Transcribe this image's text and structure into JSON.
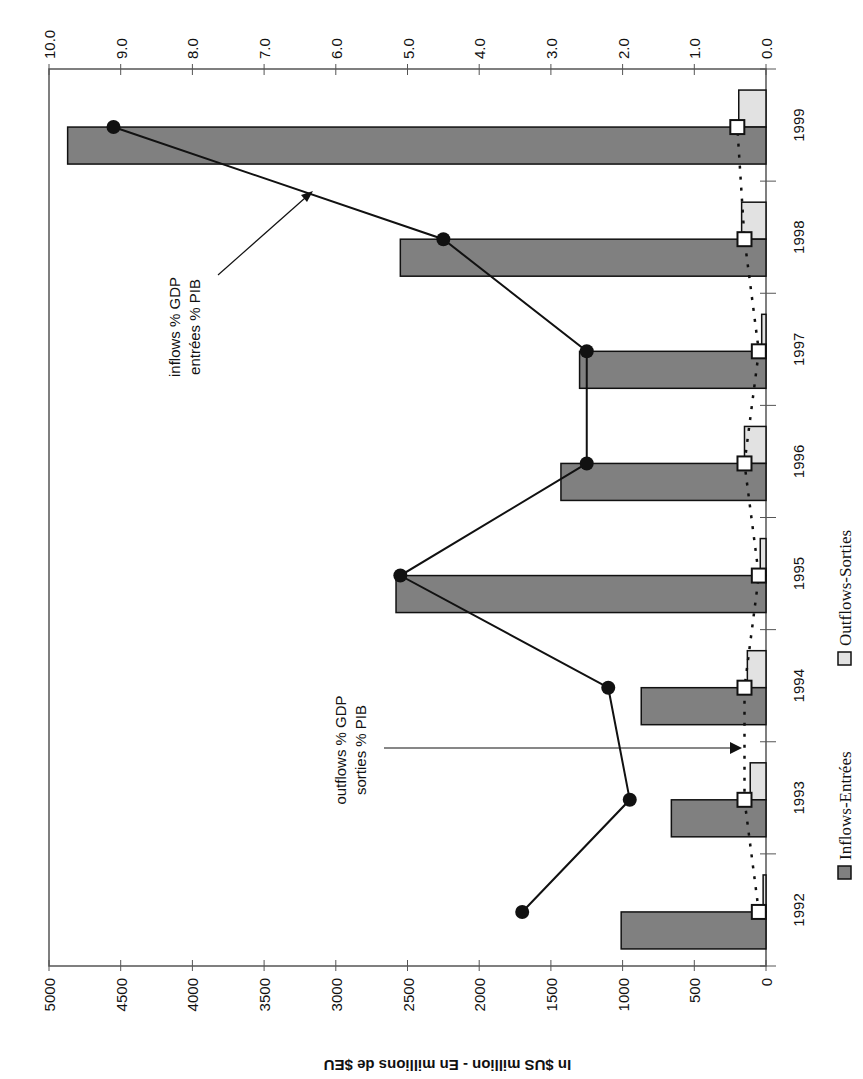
{
  "chart_data": {
    "type": "bar",
    "orientation": "rotated-90-clockwise",
    "title": "",
    "categories": [
      "1992",
      "1993",
      "1994",
      "1995",
      "1996",
      "1997",
      "1998",
      "1999"
    ],
    "series": [
      {
        "name": "Inflows-Entrées",
        "type": "bar",
        "axis": "left",
        "color": "#808080",
        "values": [
          1010,
          660,
          870,
          2580,
          1430,
          1300,
          2550,
          4870
        ]
      },
      {
        "name": "Outflows-Sorties",
        "type": "bar",
        "axis": "left",
        "color": "#e2e2e2",
        "values": [
          20,
          110,
          130,
          40,
          150,
          30,
          170,
          190
        ]
      },
      {
        "name": "inflows % GDP / entrées % PIB",
        "type": "line",
        "axis": "right",
        "marker": "filled-circle",
        "line_style": "solid",
        "values": [
          3.4,
          1.9,
          2.2,
          5.1,
          2.5,
          2.5,
          4.5,
          9.1
        ]
      },
      {
        "name": "outflows % GDP / sorties % PIB",
        "type": "line",
        "axis": "right",
        "marker": "open-square",
        "line_style": "dotted",
        "values": [
          0.1,
          0.3,
          0.3,
          0.1,
          0.3,
          0.1,
          0.3,
          0.4
        ]
      }
    ],
    "ylabel": "In $US million - En millions de $EU",
    "ylim": [
      0,
      5000
    ],
    "yticks": [
      "0",
      "500",
      "1000",
      "1500",
      "2000",
      "2500",
      "3000",
      "3500",
      "4000",
      "4500",
      "5000"
    ],
    "y2label": "",
    "y2lim": [
      0,
      10
    ],
    "y2ticks": [
      "0.0",
      "1.0",
      "2.0",
      "3.0",
      "4.0",
      "5.0",
      "6.0",
      "7.0",
      "8.0",
      "9.0",
      "10.0"
    ],
    "xlabel": "",
    "grid": false,
    "legend_position": "bottom",
    "annotations": [
      {
        "lines": [
          "inflows % GDP",
          "entrées % PIB"
        ],
        "points_to": "inflows % GDP line"
      },
      {
        "lines": [
          "outflows % GDP",
          "sorties % PIB"
        ],
        "points_to": "outflows % GDP line"
      }
    ]
  },
  "legend": {
    "items": [
      {
        "label": "Inflows-Entrées",
        "color": "#808080"
      },
      {
        "label": "Outflows-Sorties",
        "color": "#e2e2e2"
      }
    ]
  }
}
